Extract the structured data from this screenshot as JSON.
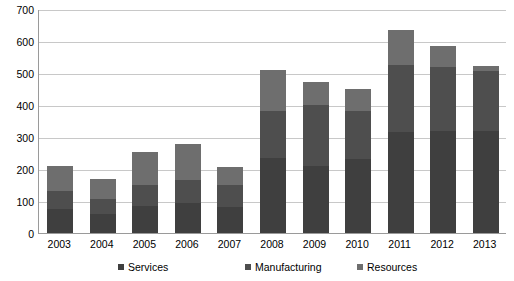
{
  "chart_data": {
    "type": "bar",
    "stacked": true,
    "title": "",
    "subtitle": "",
    "xlabel": "",
    "ylabel": "",
    "categories": [
      "2003",
      "2004",
      "2005",
      "2006",
      "2007",
      "2008",
      "2009",
      "2010",
      "2011",
      "2012",
      "2013"
    ],
    "series": [
      {
        "name": "Services",
        "color": "#3f3f3f",
        "values": [
          75,
          60,
          85,
          95,
          80,
          235,
          210,
          230,
          315,
          320,
          320
        ]
      },
      {
        "name": "Manufacturing",
        "color": "#4e4e4e",
        "values": [
          55,
          45,
          65,
          70,
          70,
          145,
          190,
          150,
          210,
          200,
          185
        ]
      },
      {
        "name": "Resources",
        "color": "#6e6e6e",
        "values": [
          80,
          65,
          102,
          112,
          57,
          130,
          73,
          70,
          110,
          63,
          17
        ]
      }
    ],
    "totals": [
      210,
      170,
      252,
      277,
      207,
      510,
      473,
      450,
      635,
      583,
      522
    ],
    "ylim": [
      0,
      700
    ],
    "ytick_step": 100,
    "yticks": [
      "700",
      "600",
      "500",
      "400",
      "300",
      "200",
      "100",
      "0"
    ],
    "grid": true,
    "legend_position": "bottom"
  },
  "legend": {
    "items": [
      {
        "label": "Services",
        "color": "#3f3f3f"
      },
      {
        "label": "Manufacturing",
        "color": "#4e4e4e"
      },
      {
        "label": "Resources",
        "color": "#6e6e6e"
      }
    ]
  },
  "axis_color": "#9a9a9a",
  "grid_color": "#c8c8c8",
  "background": "#ffffff"
}
